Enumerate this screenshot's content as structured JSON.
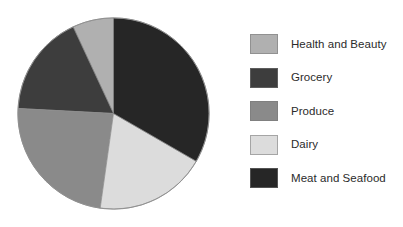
{
  "chart_data": {
    "type": "pie",
    "title": "",
    "categories": [
      "Health and Beauty",
      "Grocery",
      "Produce",
      "Dairy",
      "Meat and Seafood"
    ],
    "values": [
      7,
      17,
      24,
      19,
      33
    ],
    "units": "percent",
    "start_angle_deg": 0,
    "direction": "clockwise",
    "legend_position": "right",
    "grid": false,
    "slice_order_clockwise_from_top": [
      "Meat and Seafood",
      "Dairy",
      "Produce",
      "Grocery",
      "Health and Beauty"
    ],
    "slices": [
      {
        "label": "Health and Beauty",
        "value": 7,
        "color": "#b0b0b0",
        "start_deg": 335,
        "end_deg": 360
      },
      {
        "label": "Grocery",
        "value": 17,
        "color": "#3d3d3d",
        "start_deg": 273,
        "end_deg": 335
      },
      {
        "label": "Produce",
        "value": 24,
        "color": "#8a8a8a",
        "start_deg": 188,
        "end_deg": 273
      },
      {
        "label": "Dairy",
        "value": 19,
        "color": "#dcdcdc",
        "start_deg": 120,
        "end_deg": 188
      },
      {
        "label": "Meat and Seafood",
        "value": 33,
        "color": "#262626",
        "start_deg": 0,
        "end_deg": 120
      }
    ]
  },
  "legend": {
    "items": [
      {
        "label": "Health and Beauty",
        "color": "#b0b0b0"
      },
      {
        "label": "Grocery",
        "color": "#3d3d3d"
      },
      {
        "label": "Produce",
        "color": "#8a8a8a"
      },
      {
        "label": "Dairy",
        "color": "#dcdcdc"
      },
      {
        "label": "Meat and Seafood",
        "color": "#262626"
      }
    ]
  },
  "colors": {
    "background": "#ffffff",
    "pie_outline": "#8d8d8d",
    "text": "#2b2b2b"
  }
}
